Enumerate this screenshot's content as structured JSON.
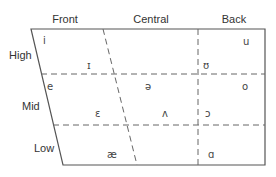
{
  "columns": [
    {
      "key": "front",
      "label": "Front"
    },
    {
      "key": "central",
      "label": "Central"
    },
    {
      "key": "back",
      "label": "Back"
    }
  ],
  "rows": [
    {
      "key": "high",
      "label": "High"
    },
    {
      "key": "mid",
      "label": "Mid"
    },
    {
      "key": "low",
      "label": "Low"
    }
  ],
  "vowels": [
    {
      "symbol": "i",
      "height": "high",
      "backness": "front"
    },
    {
      "symbol": "ɪ",
      "height": "high",
      "backness": "front-lax"
    },
    {
      "symbol": "u",
      "height": "high",
      "backness": "back"
    },
    {
      "symbol": "ʊ",
      "height": "high",
      "backness": "back-lax"
    },
    {
      "symbol": "e",
      "height": "mid",
      "backness": "front"
    },
    {
      "symbol": "ə",
      "height": "mid",
      "backness": "central"
    },
    {
      "symbol": "o",
      "height": "mid",
      "backness": "back"
    },
    {
      "symbol": "ɛ",
      "height": "mid",
      "backness": "front-lax"
    },
    {
      "symbol": "ʌ",
      "height": "mid",
      "backness": "central-lax"
    },
    {
      "symbol": "ɔ",
      "height": "mid",
      "backness": "back-lax"
    },
    {
      "symbol": "æ",
      "height": "low",
      "backness": "front"
    },
    {
      "symbol": "ɑ",
      "height": "low",
      "backness": "back"
    }
  ]
}
